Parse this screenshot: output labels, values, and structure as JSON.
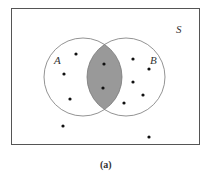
{
  "figure": {
    "caption": "(a)",
    "sample_space_label": "S",
    "set_a_label": "A",
    "set_b_label": "B",
    "shaded_region": "A ∩ B",
    "colors": {
      "border": "#555555",
      "circle": "#777777",
      "shade": "#999999",
      "dot": "#111111"
    },
    "points": [
      {
        "x": 76,
        "y": 54,
        "region": "A only"
      },
      {
        "x": 64,
        "y": 74,
        "region": "A only"
      },
      {
        "x": 70,
        "y": 99,
        "region": "A only"
      },
      {
        "x": 104,
        "y": 64,
        "region": "A and B"
      },
      {
        "x": 103,
        "y": 88,
        "region": "A and B"
      },
      {
        "x": 133,
        "y": 59,
        "region": "B only"
      },
      {
        "x": 149,
        "y": 69,
        "region": "B only"
      },
      {
        "x": 133,
        "y": 82,
        "region": "B only"
      },
      {
        "x": 143,
        "y": 95,
        "region": "B only"
      },
      {
        "x": 124,
        "y": 103,
        "region": "B only"
      },
      {
        "x": 63,
        "y": 126,
        "region": "outside"
      },
      {
        "x": 149,
        "y": 137,
        "region": "outside"
      }
    ]
  }
}
